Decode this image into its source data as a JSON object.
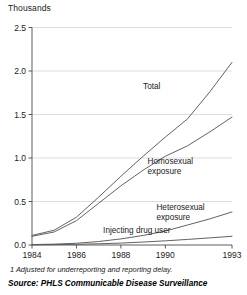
{
  "figure": {
    "y_unit_label": "Thousands",
    "footnote": "1  Adjusted for underreporting and reporting delay.",
    "source": "Source: PHLS Communicable Disease Surveillance"
  },
  "chart_data": {
    "type": "line",
    "title": "",
    "subtitle": "",
    "xlabel": "",
    "ylabel": "Thousands",
    "xlim": [
      1984,
      1993
    ],
    "ylim": [
      0.0,
      2.5
    ],
    "grid": true,
    "legend_position": "inline-annotations",
    "xticks": [
      1984,
      1986,
      1988,
      1990,
      1993
    ],
    "xtick_labels": [
      "1984",
      "1986",
      "1988",
      "1990",
      "1993"
    ],
    "yticks": [
      0.0,
      0.5,
      1.0,
      1.5,
      2.0,
      2.5
    ],
    "ytick_labels": [
      "0.0",
      "0.5",
      "1.0",
      "1.5",
      "2.0",
      "2.5"
    ],
    "x": [
      1984,
      1985,
      1986,
      1987,
      1988,
      1989,
      1990,
      1991,
      1992,
      1993
    ],
    "series": [
      {
        "name": "Total",
        "label": "Total",
        "label_x": 1989.0,
        "label_y": 1.79,
        "values": [
          0.11,
          0.17,
          0.32,
          0.55,
          0.79,
          1.02,
          1.24,
          1.45,
          1.76,
          2.1
        ]
      },
      {
        "name": "Homosexual exposure",
        "label": "Homosexual\nexposure",
        "label_line1": "Homosexual",
        "label_line2": "exposure",
        "label_x": 1989.2,
        "label_y": 0.93,
        "values": [
          0.1,
          0.15,
          0.28,
          0.48,
          0.68,
          0.86,
          1.02,
          1.14,
          1.3,
          1.47
        ]
      },
      {
        "name": "Heterosexual exposure",
        "label": "Heterosexual\nexposure",
        "label_line1": "Heterosexual",
        "label_line2": "exposure",
        "label_x": 1989.6,
        "label_y": 0.4,
        "values": [
          0.005,
          0.01,
          0.02,
          0.04,
          0.07,
          0.11,
          0.16,
          0.23,
          0.3,
          0.38
        ]
      },
      {
        "name": "Injecting drug user",
        "label": "Injecting drug user",
        "label_x": 1987.2,
        "label_y": 0.14,
        "values": [
          0.002,
          0.004,
          0.008,
          0.014,
          0.022,
          0.034,
          0.048,
          0.064,
          0.082,
          0.1
        ]
      }
    ]
  },
  "colors": {
    "line": "#5a5a5a",
    "grid": "#cfcfcf",
    "axis": "#4a4a4a",
    "text": "#1a1a1a"
  }
}
